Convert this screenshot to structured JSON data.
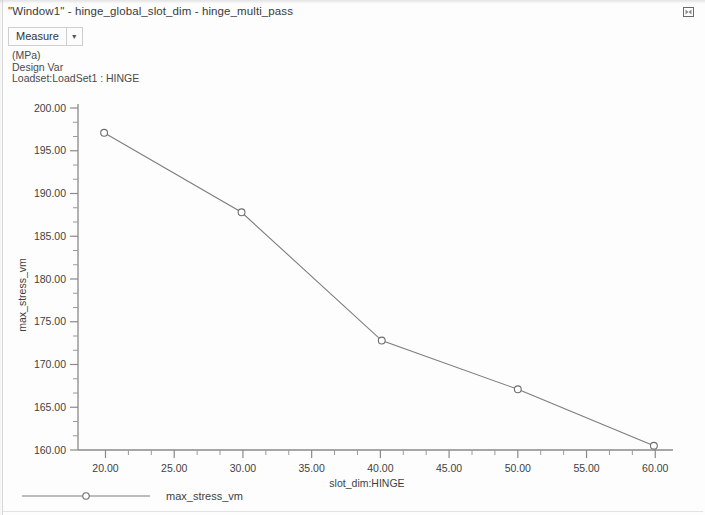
{
  "window": {
    "title": "\"Window1\" - hinge_global_slot_dim - hinge_multi_pass",
    "restore_icon": "restore-window-icon"
  },
  "toolbar": {
    "measure_label": "Measure",
    "dropdown_icon": "chevron-down-icon"
  },
  "annotations": {
    "units": "(MPa)",
    "design_var": "Design Var",
    "loadset": "Loadset:LoadSet1 :  HINGE"
  },
  "legend": {
    "entries": [
      {
        "label": "max_stress_vm",
        "marker": "circle",
        "color": "#7d7d7d"
      }
    ]
  },
  "colors": {
    "line": "#7d7d7d",
    "axis": "#8a8a8a",
    "text": "#3f3f3f",
    "background": "#fdfdfd"
  },
  "chart_data": {
    "type": "line",
    "title": "",
    "subtitle": "",
    "xlabel": "slot_dim:HINGE",
    "ylabel": "max_stress_vm",
    "xlim": [
      18.0,
      61.0
    ],
    "ylim": [
      160.0,
      200.0
    ],
    "xticks": [
      20.0,
      25.0,
      30.0,
      35.0,
      40.0,
      45.0,
      50.0,
      55.0,
      60.0
    ],
    "yticks": [
      160.0,
      165.0,
      170.0,
      175.0,
      180.0,
      185.0,
      190.0,
      195.0,
      200.0
    ],
    "xtick_labels": [
      "20.00",
      "25.00",
      "30.00",
      "35.00",
      "40.00",
      "45.00",
      "50.00",
      "55.00",
      "60.00"
    ],
    "ytick_labels": [
      "160.00",
      "165.00",
      "170.00",
      "175.00",
      "180.00",
      "185.00",
      "190.00",
      "195.00",
      "200.00"
    ],
    "minor_ticks_per_interval": 2,
    "grid": false,
    "legend_position": "bottom-left",
    "units": "MPa",
    "series": [
      {
        "name": "max_stress_vm",
        "marker": "circle",
        "color": "#7d7d7d",
        "x": [
          19.9,
          29.9,
          40.1,
          50.0,
          59.9
        ],
        "y": [
          197.1,
          187.8,
          172.8,
          167.1,
          160.5
        ]
      }
    ]
  }
}
